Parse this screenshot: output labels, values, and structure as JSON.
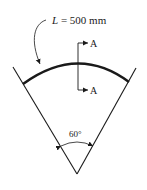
{
  "figure": {
    "length_label_var": "L",
    "length_label_rest": " = 500 mm",
    "section_label_top": "A",
    "section_label_bottom": "A",
    "angle_label": "60°"
  },
  "colors": {
    "stroke": "#1a1a1a",
    "background": "#ffffff"
  }
}
